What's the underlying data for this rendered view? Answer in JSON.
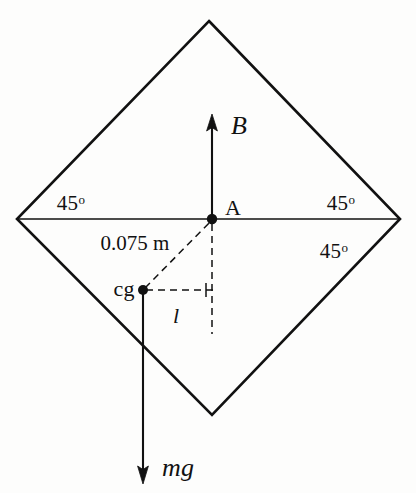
{
  "figure": {
    "caption_visible": false,
    "colors": {
      "ink": "#111111",
      "background": "#fdfdfc"
    },
    "geometry": {
      "diamond_vertices": {
        "top": [
          209,
          21
        ],
        "left": [
          17,
          219
        ],
        "right": [
          400,
          219
        ],
        "bottom": [
          212,
          415
        ]
      },
      "point_A": [
        212,
        219
      ],
      "point_cg": [
        143,
        290
      ],
      "B_arrow_tip": [
        212,
        116
      ],
      "mg_arrow_tip": [
        143,
        483
      ],
      "dashed_corner": [
        212,
        290
      ],
      "dashed_vertical_bottom": [
        212,
        334
      ]
    },
    "labels": {
      "angle_top_left": "45",
      "angle_top_left_sup": "o",
      "angle_top_right": "45",
      "angle_top_right_sup": "o",
      "angle_bottom_right": "45",
      "angle_bottom_right_sup": "o",
      "point_a": "A",
      "point_cg": "cg",
      "buoyancy_force": "B",
      "weight_force": "mg",
      "distance_to_cg": "0.075 m",
      "lever_arm": "l"
    }
  }
}
